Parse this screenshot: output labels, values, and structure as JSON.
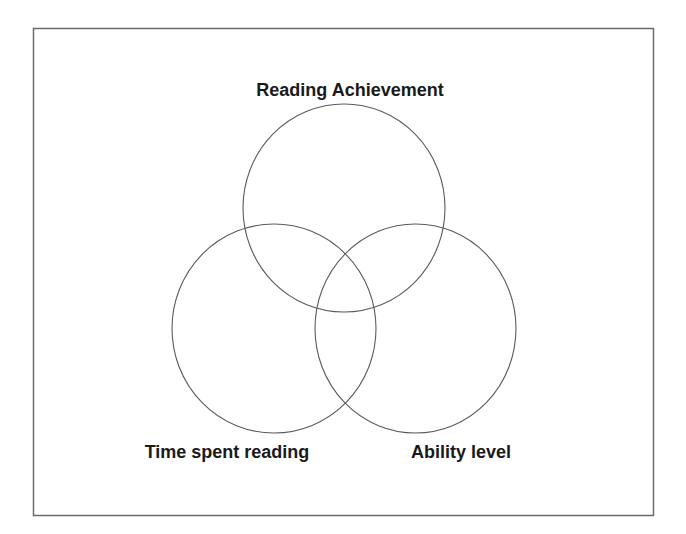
{
  "diagram": {
    "type": "venn",
    "frame": {
      "x": 33,
      "y": 28,
      "width": 620,
      "height": 487,
      "stroke": "#6b6b6b"
    },
    "circles": [
      {
        "id": "reading-achievement",
        "label": "Reading Achievement",
        "cx": 344,
        "cy": 208,
        "rx": 101,
        "ry": 104
      },
      {
        "id": "time-spent-reading",
        "label": "Time spent reading",
        "cx": 274,
        "cy": 328,
        "rx": 102,
        "ry": 105
      },
      {
        "id": "ability-level",
        "label": "Ability level",
        "cx": 415,
        "cy": 328,
        "rx": 101,
        "ry": 105
      }
    ],
    "labels": {
      "top": "Reading Achievement",
      "bottom_left": "Time spent reading",
      "bottom_right": "Ability level"
    },
    "colors": {
      "stroke": "#5a5a5a",
      "text": "#1a1a1a",
      "background": "#ffffff"
    }
  }
}
